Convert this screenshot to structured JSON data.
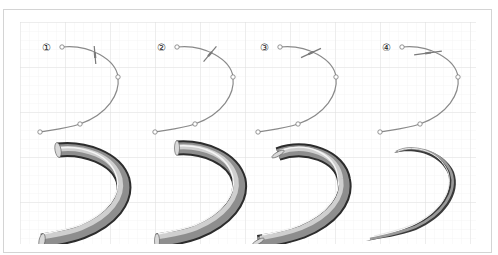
{
  "figure": {
    "background_grid": {
      "minor_spacing": 9,
      "major_spacing": 45,
      "minor_color": "#ececec",
      "major_color": "#d6d6d6"
    },
    "colors": {
      "curve": "#8a8a8a",
      "control_point_fill": "#ffffff",
      "control_point_stroke": "#7a7a7a",
      "cross": "#7a7a7a",
      "tube_dark": "#2e2e2e",
      "tube_mid": "#8c8c8c",
      "tube_light": "#f2f2f2"
    },
    "panels": [
      {
        "label": "①",
        "step": 1,
        "cross_angle_deg": 85,
        "tube_style": "full"
      },
      {
        "label": "②",
        "step": 2,
        "cross_angle_deg": 50,
        "tube_style": "full"
      },
      {
        "label": "③",
        "step": 3,
        "cross_angle_deg": 25,
        "tube_style": "full"
      },
      {
        "label": "④",
        "step": 4,
        "cross_angle_deg": 8,
        "tube_style": "tapered"
      }
    ]
  }
}
